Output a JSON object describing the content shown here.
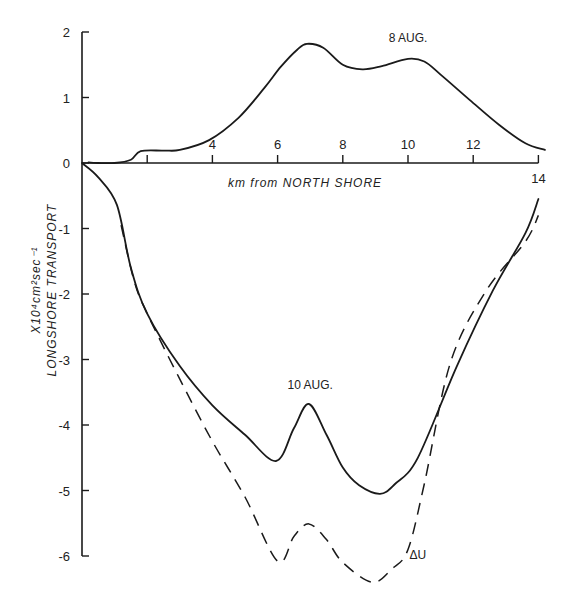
{
  "chart_data": {
    "type": "line",
    "title": "",
    "xlabel": "km from NORTH SHORE",
    "ylabel": "LONGSHORE TRANSPORT",
    "ylabel_units": "X10⁴cm²sec⁻¹",
    "xlim": [
      0,
      14
    ],
    "ylim": [
      -6,
      2
    ],
    "x_ticks": [
      2,
      4,
      6,
      8,
      10,
      12,
      14
    ],
    "x_tick_labels": [
      "",
      "4",
      "6",
      "8",
      "10",
      "12",
      "14"
    ],
    "y_ticks": [
      2,
      1,
      0,
      -1,
      -2,
      -3,
      -4,
      -5,
      -6
    ],
    "y_tick_labels": [
      "2",
      "1",
      "0",
      "-1",
      "-2",
      "-3",
      "-4",
      "-5",
      "-6"
    ],
    "grid": false,
    "legend": "none (inline labels)",
    "series": [
      {
        "name": "8 AUG.",
        "style": "solid",
        "x": [
          0.2,
          0.5,
          1.0,
          1.5,
          1.8,
          2.5,
          3.0,
          3.9,
          4.8,
          5.6,
          6.1,
          6.6,
          6.9,
          7.4,
          8.0,
          8.6,
          9.2,
          10.0,
          10.5,
          11.0,
          11.9,
          12.8,
          13.6,
          14.2
        ],
        "y": [
          0.01,
          0.0,
          0.0,
          0.05,
          0.18,
          0.19,
          0.2,
          0.35,
          0.69,
          1.15,
          1.47,
          1.73,
          1.82,
          1.76,
          1.5,
          1.43,
          1.48,
          1.59,
          1.55,
          1.35,
          0.96,
          0.58,
          0.3,
          0.2
        ]
      },
      {
        "name": "10 AUG.",
        "style": "solid",
        "x": [
          0.0,
          0.5,
          1.07,
          1.5,
          2.0,
          3.0,
          4.0,
          5.0,
          5.95,
          6.5,
          6.96,
          7.5,
          8.0,
          8.5,
          9.14,
          9.6,
          10.3,
          11.5,
          12.6,
          13.6,
          14.0
        ],
        "y": [
          0.0,
          -0.22,
          -0.64,
          -1.6,
          -2.3,
          -3.1,
          -3.7,
          -4.15,
          -4.55,
          -4.05,
          -3.68,
          -4.15,
          -4.65,
          -4.92,
          -5.05,
          -4.9,
          -4.5,
          -3.1,
          -1.95,
          -1.07,
          -0.55
        ]
      },
      {
        "name": "ΔU",
        "style": "dashed",
        "x": [
          1.2,
          1.6,
          2.0,
          3.0,
          4.0,
          5.0,
          6.0,
          6.5,
          6.96,
          7.5,
          8.0,
          8.9,
          9.5,
          10.0,
          10.5,
          11.3,
          12.4,
          13.6,
          14.0
        ],
        "y": [
          -0.95,
          -1.8,
          -2.3,
          -3.3,
          -4.25,
          -5.1,
          -6.08,
          -5.7,
          -5.51,
          -5.75,
          -6.1,
          -6.4,
          -6.2,
          -5.9,
          -4.9,
          -3.05,
          -1.95,
          -1.2,
          -0.8
        ]
      }
    ],
    "annotations": [
      {
        "text": "8 AUG.",
        "x": 10.0,
        "y": 1.85
      },
      {
        "text": "10 AUG.",
        "x": 7.0,
        "y": -3.45
      },
      {
        "text": "ΔU",
        "x": 10.3,
        "y": -6.05
      }
    ]
  }
}
